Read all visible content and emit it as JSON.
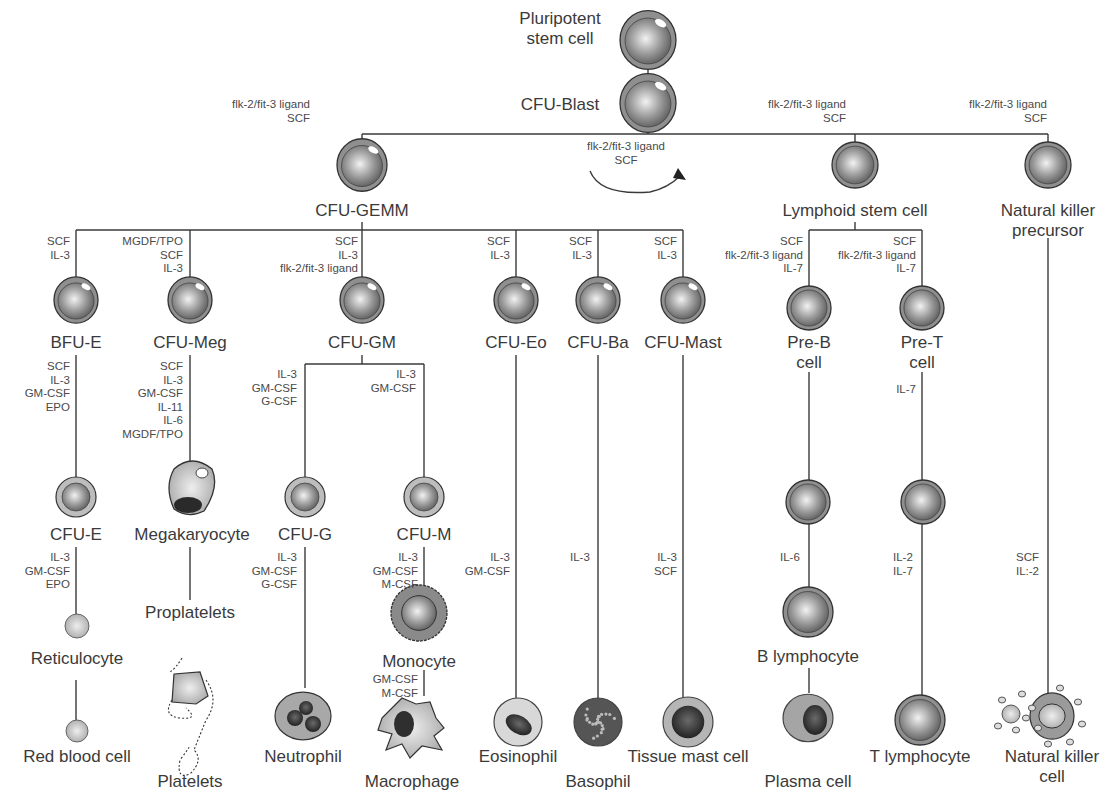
{
  "diagram": {
    "colors": {
      "line": "#3a3a3a",
      "cell_outer": "#8c8c8c",
      "cell_core": "#9a9a9a",
      "text": "#3a3a3a",
      "factor_text": "#4a4a4a",
      "background": "#ffffff"
    },
    "nodes": [
      {
        "id": "psc",
        "label": [
          "Pluripotent",
          "stem cell"
        ],
        "x": 648,
        "y": 40,
        "r": 28,
        "type": "stem",
        "lx": 560,
        "ly": 24,
        "anchor": "middle"
      },
      {
        "id": "blast",
        "label": [
          "CFU-Blast"
        ],
        "x": 648,
        "y": 103,
        "r": 28,
        "type": "stem",
        "lx": 560,
        "ly": 110,
        "anchor": "middle"
      },
      {
        "id": "gemm",
        "label": [
          "CFU-GEMM"
        ],
        "x": 362,
        "y": 165,
        "r": 25,
        "type": "stem",
        "lx": 362,
        "ly": 216,
        "anchor": "middle"
      },
      {
        "id": "lymph",
        "label": [
          "Lymphoid stem cell"
        ],
        "x": 855,
        "y": 165,
        "r": 23,
        "type": "lymph",
        "lx": 855,
        "ly": 216,
        "anchor": "middle"
      },
      {
        "id": "nkp",
        "label": [
          "Natural killer",
          "precursor"
        ],
        "x": 1048,
        "y": 165,
        "r": 23,
        "type": "lymph",
        "lx": 1048,
        "ly": 216,
        "anchor": "middle"
      },
      {
        "id": "bfue",
        "label": [
          "BFU-E"
        ],
        "x": 76,
        "y": 300,
        "r": 22,
        "type": "stem",
        "lx": 76,
        "ly": 348,
        "anchor": "middle"
      },
      {
        "id": "cfumeg",
        "label": [
          "CFU-Meg"
        ],
        "x": 190,
        "y": 300,
        "r": 22,
        "type": "stem",
        "lx": 190,
        "ly": 348,
        "anchor": "middle"
      },
      {
        "id": "cfugm",
        "label": [
          "CFU-GM"
        ],
        "x": 362,
        "y": 300,
        "r": 22,
        "type": "stem",
        "lx": 362,
        "ly": 348,
        "anchor": "middle"
      },
      {
        "id": "cfueo",
        "label": [
          "CFU-Eo"
        ],
        "x": 516,
        "y": 300,
        "r": 22,
        "type": "stem",
        "lx": 516,
        "ly": 348,
        "anchor": "middle"
      },
      {
        "id": "cfuba",
        "label": [
          "CFU-Ba"
        ],
        "x": 598,
        "y": 300,
        "r": 22,
        "type": "stem",
        "lx": 598,
        "ly": 348,
        "anchor": "middle"
      },
      {
        "id": "cfumast",
        "label": [
          "CFU-Mast"
        ],
        "x": 683,
        "y": 300,
        "r": 22,
        "type": "stem",
        "lx": 683,
        "ly": 348,
        "anchor": "middle"
      },
      {
        "id": "preb",
        "label": [
          "Pre-B",
          "cell"
        ],
        "x": 809,
        "y": 308,
        "r": 22,
        "type": "lymph",
        "lx": 809,
        "ly": 348,
        "anchor": "middle"
      },
      {
        "id": "pret",
        "label": [
          "Pre-T",
          "cell"
        ],
        "x": 922,
        "y": 308,
        "r": 22,
        "type": "lymph",
        "lx": 922,
        "ly": 348,
        "anchor": "middle"
      },
      {
        "id": "cfue",
        "label": [
          "CFU-E"
        ],
        "x": 76,
        "y": 497,
        "r": 20,
        "type": "ring",
        "lx": 76,
        "ly": 540,
        "anchor": "middle"
      },
      {
        "id": "mega",
        "label": [
          "Megakaryocyte"
        ],
        "x": 192,
        "y": 487,
        "r": 26,
        "type": "mega",
        "lx": 192,
        "ly": 540,
        "anchor": "middle"
      },
      {
        "id": "cfug",
        "label": [
          "CFU-G"
        ],
        "x": 305,
        "y": 497,
        "r": 20,
        "type": "ring",
        "lx": 305,
        "ly": 540,
        "anchor": "middle"
      },
      {
        "id": "cfum",
        "label": [
          "CFU-M"
        ],
        "x": 424,
        "y": 497,
        "r": 20,
        "type": "ring",
        "lx": 424,
        "ly": 540,
        "anchor": "middle"
      },
      {
        "id": "bpre",
        "label": [],
        "x": 808,
        "y": 502,
        "r": 22,
        "type": "lymph",
        "lx": 0,
        "ly": 0,
        "anchor": "middle"
      },
      {
        "id": "tpre",
        "label": [],
        "x": 923,
        "y": 502,
        "r": 22,
        "type": "lymph",
        "lx": 923,
        "ly": 0,
        "anchor": "middle"
      },
      {
        "id": "retic",
        "label": [
          "Reticulocyte"
        ],
        "x": 77,
        "y": 626,
        "r": 12,
        "type": "small",
        "lx": 77,
        "ly": 664,
        "anchor": "middle"
      },
      {
        "id": "prop",
        "label": [
          "Proplatelets"
        ],
        "x": 190,
        "y": 670,
        "r": 0,
        "type": "none",
        "lx": 190,
        "ly": 618,
        "anchor": "middle"
      },
      {
        "id": "mono",
        "label": [
          "Monocyte"
        ],
        "x": 419,
        "y": 613,
        "r": 28,
        "type": "mono",
        "lx": 419,
        "ly": 667,
        "anchor": "middle"
      },
      {
        "id": "blym",
        "label": [
          "B lymphocyte"
        ],
        "x": 808,
        "y": 612,
        "r": 25,
        "type": "lymph",
        "lx": 808,
        "ly": 662,
        "anchor": "middle"
      },
      {
        "id": "rbc",
        "label": [
          "Red blood cell"
        ],
        "x": 77,
        "y": 731,
        "r": 11,
        "type": "small",
        "lx": 77,
        "ly": 762,
        "anchor": "middle"
      },
      {
        "id": "platelets",
        "label": [
          "Platelets"
        ],
        "x": 190,
        "y": 700,
        "r": 0,
        "type": "platelets",
        "lx": 190,
        "ly": 787,
        "anchor": "middle"
      },
      {
        "id": "neutro",
        "label": [
          "Neutrophil"
        ],
        "x": 303,
        "y": 716,
        "r": 28,
        "type": "neutro",
        "lx": 303,
        "ly": 762,
        "anchor": "middle"
      },
      {
        "id": "macro",
        "label": [
          "Macrophage"
        ],
        "x": 412,
        "y": 728,
        "r": 32,
        "type": "macro",
        "lx": 412,
        "ly": 787,
        "anchor": "middle"
      },
      {
        "id": "eosino",
        "label": [
          "Eosinophil"
        ],
        "x": 518,
        "y": 722,
        "r": 24,
        "type": "eosino",
        "lx": 518,
        "ly": 762,
        "anchor": "middle"
      },
      {
        "id": "baso",
        "label": [
          "Basophil"
        ],
        "x": 598,
        "y": 722,
        "r": 24,
        "type": "baso",
        "lx": 598,
        "ly": 787,
        "anchor": "middle"
      },
      {
        "id": "mast",
        "label": [
          "Tissue mast cell"
        ],
        "x": 688,
        "y": 722,
        "r": 25,
        "type": "mast",
        "lx": 688,
        "ly": 762,
        "anchor": "middle"
      },
      {
        "id": "plasma",
        "label": [
          "Plasma cell"
        ],
        "x": 808,
        "y": 718,
        "r": 25,
        "type": "plasma",
        "lx": 808,
        "ly": 787,
        "anchor": "middle"
      },
      {
        "id": "tlym",
        "label": [
          "T lymphocyte"
        ],
        "x": 920,
        "y": 720,
        "r": 25,
        "type": "lymph",
        "lx": 920,
        "ly": 762,
        "anchor": "middle"
      },
      {
        "id": "nk",
        "label": [
          "Natural killer",
          "cell"
        ],
        "x": 1052,
        "y": 716,
        "r": 22,
        "type": "nk",
        "lx": 1052,
        "ly": 762,
        "anchor": "middle"
      }
    ],
    "lines": [
      [
        648,
        68,
        648,
        75
      ],
      [
        648,
        131,
        648,
        134
      ],
      [
        362,
        134,
        1048,
        134
      ],
      [
        362,
        134,
        362,
        140
      ],
      [
        855,
        134,
        855,
        142
      ],
      [
        1048,
        134,
        1048,
        142
      ],
      [
        362,
        222,
        362,
        230
      ],
      [
        76,
        230,
        683,
        230
      ],
      [
        76,
        230,
        76,
        278
      ],
      [
        190,
        230,
        190,
        278
      ],
      [
        362,
        230,
        362,
        278
      ],
      [
        516,
        230,
        516,
        278
      ],
      [
        598,
        230,
        598,
        278
      ],
      [
        683,
        230,
        683,
        278
      ],
      [
        855,
        222,
        855,
        230
      ],
      [
        809,
        230,
        922,
        230
      ],
      [
        809,
        230,
        809,
        286
      ],
      [
        922,
        230,
        922,
        286
      ],
      [
        76,
        355,
        76,
        477
      ],
      [
        190,
        355,
        190,
        462
      ],
      [
        362,
        355,
        362,
        364
      ],
      [
        305,
        364,
        424,
        364
      ],
      [
        305,
        364,
        305,
        477
      ],
      [
        424,
        364,
        424,
        477
      ],
      [
        516,
        355,
        516,
        698
      ],
      [
        598,
        355,
        598,
        698
      ],
      [
        683,
        355,
        683,
        697
      ],
      [
        809,
        372,
        809,
        480
      ],
      [
        922,
        372,
        922,
        480
      ],
      [
        809,
        524,
        809,
        587
      ],
      [
        922,
        524,
        922,
        695
      ],
      [
        809,
        668,
        809,
        693
      ],
      [
        1048,
        238,
        1048,
        694
      ],
      [
        76,
        547,
        76,
        614
      ],
      [
        76,
        680,
        76,
        720
      ],
      [
        190,
        547,
        190,
        600
      ],
      [
        305,
        547,
        305,
        688
      ],
      [
        424,
        547,
        424,
        585
      ],
      [
        424,
        670,
        424,
        696
      ]
    ],
    "factors": [
      {
        "x": 310,
        "y": 108,
        "anchor": "end",
        "lines": [
          "flk-2/fit-3 ligand",
          "SCF"
        ]
      },
      {
        "x": 626,
        "y": 150,
        "anchor": "middle",
        "lines": [
          "flk-2/fit-3 ligand",
          "SCF"
        ]
      },
      {
        "x": 846,
        "y": 108,
        "anchor": "end",
        "lines": [
          "flk-2/fit-3 ligand",
          "SCF"
        ]
      },
      {
        "x": 1047,
        "y": 108,
        "anchor": "end",
        "lines": [
          "flk-2/fit-3 ligand",
          "SCF"
        ]
      },
      {
        "x": 70,
        "y": 245,
        "anchor": "end",
        "lines": [
          "SCF",
          "IL-3"
        ]
      },
      {
        "x": 183,
        "y": 245,
        "anchor": "end",
        "lines": [
          "MGDF/TPO",
          "SCF",
          "IL-3"
        ]
      },
      {
        "x": 358,
        "y": 245,
        "anchor": "end",
        "lines": [
          "SCF",
          "IL-3",
          "flk-2/fit-3 ligand"
        ]
      },
      {
        "x": 510,
        "y": 245,
        "anchor": "end",
        "lines": [
          "SCF",
          "IL-3"
        ]
      },
      {
        "x": 592,
        "y": 245,
        "anchor": "end",
        "lines": [
          "SCF",
          "IL-3"
        ]
      },
      {
        "x": 677,
        "y": 245,
        "anchor": "end",
        "lines": [
          "SCF",
          "IL-3"
        ]
      },
      {
        "x": 803,
        "y": 245,
        "anchor": "end",
        "lines": [
          "SCF",
          "flk-2/fit-3 ligand",
          "IL-7"
        ]
      },
      {
        "x": 916,
        "y": 245,
        "anchor": "end",
        "lines": [
          "SCF",
          "flk-2/fit-3 ligand",
          "IL-7"
        ]
      },
      {
        "x": 70,
        "y": 370,
        "anchor": "end",
        "lines": [
          "SCF",
          "IL-3",
          "GM-CSF",
          "EPO"
        ]
      },
      {
        "x": 183,
        "y": 370,
        "anchor": "end",
        "lines": [
          "SCF",
          "IL-3",
          "GM-CSF",
          "IL-11",
          "IL-6",
          "MGDF/TPO"
        ]
      },
      {
        "x": 297,
        "y": 378,
        "anchor": "end",
        "lines": [
          "IL-3",
          "GM-CSF",
          "G-CSF"
        ]
      },
      {
        "x": 416,
        "y": 378,
        "anchor": "end",
        "lines": [
          "IL-3",
          "GM-CSF"
        ]
      },
      {
        "x": 916,
        "y": 393,
        "anchor": "end",
        "lines": [
          "IL-7"
        ]
      },
      {
        "x": 70,
        "y": 561,
        "anchor": "end",
        "lines": [
          "IL-3",
          "GM-CSF",
          "EPO"
        ]
      },
      {
        "x": 297,
        "y": 561,
        "anchor": "end",
        "lines": [
          "IL-3",
          "GM-CSF",
          "G-CSF"
        ]
      },
      {
        "x": 418,
        "y": 561,
        "anchor": "end",
        "lines": [
          "IL-3",
          "GM-CSF",
          "M-CSF"
        ]
      },
      {
        "x": 510,
        "y": 561,
        "anchor": "end",
        "lines": [
          "IL-3",
          "GM-CSF"
        ]
      },
      {
        "x": 570,
        "y": 561,
        "anchor": "start",
        "lines": [
          "IL-3"
        ]
      },
      {
        "x": 677,
        "y": 561,
        "anchor": "end",
        "lines": [
          "IL-3",
          "SCF"
        ]
      },
      {
        "x": 780,
        "y": 561,
        "anchor": "start",
        "lines": [
          "IL-6"
        ]
      },
      {
        "x": 893,
        "y": 561,
        "anchor": "start",
        "lines": [
          "IL-2",
          "IL-7"
        ]
      },
      {
        "x": 1016,
        "y": 561,
        "anchor": "start",
        "lines": [
          "SCF",
          "IL:-2"
        ]
      },
      {
        "x": 418,
        "y": 683,
        "anchor": "end",
        "lines": [
          "GM-CSF",
          "M-CSF"
        ]
      }
    ]
  }
}
